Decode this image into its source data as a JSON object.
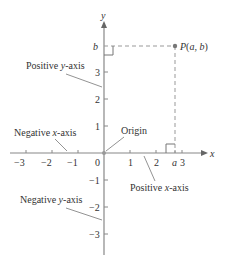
{
  "diagram": {
    "axis_labels": {
      "x": "x",
      "y": "y"
    },
    "x_ticks": [
      {
        "label": "−3",
        "x": 26
      },
      {
        "label": "−2",
        "x": 52
      },
      {
        "label": "−1",
        "x": 78
      },
      {
        "label": "0",
        "x": 98
      },
      {
        "label": "1",
        "x": 130
      },
      {
        "label": "2",
        "x": 156
      },
      {
        "label": "3",
        "x": 183
      }
    ],
    "y_ticks": [
      {
        "label": "3",
        "y": 72
      },
      {
        "label": "2",
        "y": 99
      },
      {
        "label": "1",
        "y": 126
      },
      {
        "label": "−1",
        "y": 180
      },
      {
        "label": "−2",
        "y": 207
      },
      {
        "label": "−3",
        "y": 234
      }
    ],
    "point": {
      "label": "P(a, b)",
      "a_label": "a",
      "b_label": "b"
    },
    "annotations": {
      "positive_y": "Positive y-axis",
      "negative_x": "Negative x-axis",
      "origin": "Origin",
      "positive_x": "Positive x-axis",
      "negative_y": "Negative y-axis"
    },
    "colors": {
      "axis": "#888888",
      "text": "#333333",
      "dash": "#999999",
      "point": "#777777"
    }
  }
}
